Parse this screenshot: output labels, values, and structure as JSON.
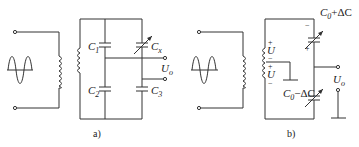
{
  "panels": [
    {
      "id": "a",
      "caption": "a)",
      "labels": {
        "c1": "C",
        "c1_sub": "1",
        "c2": "C",
        "c2_sub": "2",
        "c3": "C",
        "c3_sub": "3",
        "cx": "C",
        "cx_sub": "x",
        "uo": "U",
        "uo_sub": "o"
      }
    },
    {
      "id": "b",
      "caption": "b)",
      "labels": {
        "top_cap": "C",
        "top_cap_sub": "0",
        "top_cap_rest": "+ΔC",
        "bot_cap": "C",
        "bot_cap_sub": "0",
        "bot_cap_rest": "−ΔC",
        "u_upper": "U",
        "u_lower": "U",
        "plus": "+",
        "minus": "−",
        "uo": "U",
        "uo_sub": "o"
      }
    }
  ]
}
